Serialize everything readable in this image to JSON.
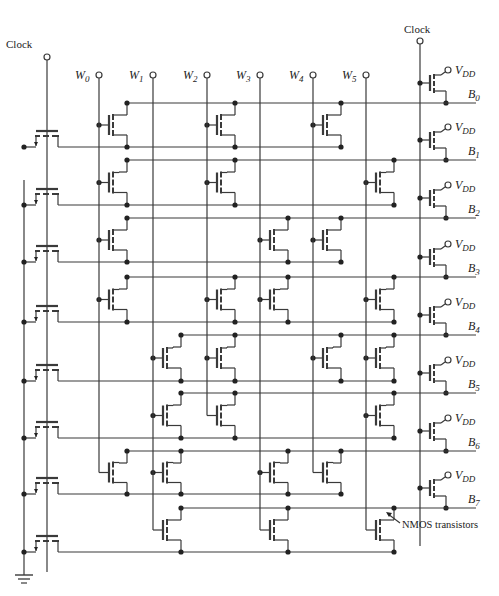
{
  "diagram": {
    "type": "NMOS ROM array with clocked PMOS precharge",
    "clock_left_label": "Clock",
    "clock_right_label": "Clock",
    "vdd_label": "V",
    "vdd_sub": "DD",
    "annotation": "NMOS transistors",
    "word_lines": [
      {
        "label": "W",
        "sub": "0"
      },
      {
        "label": "W",
        "sub": "1"
      },
      {
        "label": "W",
        "sub": "2"
      },
      {
        "label": "W",
        "sub": "3"
      },
      {
        "label": "W",
        "sub": "4"
      },
      {
        "label": "W",
        "sub": "5"
      }
    ],
    "bit_lines": [
      {
        "label": "B",
        "sub": "0",
        "transistors_at": [
          0,
          2,
          4
        ]
      },
      {
        "label": "B",
        "sub": "1",
        "transistors_at": [
          0,
          2,
          5
        ]
      },
      {
        "label": "B",
        "sub": "2",
        "transistors_at": [
          0,
          3,
          4
        ]
      },
      {
        "label": "B",
        "sub": "3",
        "transistors_at": [
          0,
          2,
          3,
          5
        ]
      },
      {
        "label": "B",
        "sub": "4",
        "transistors_at": [
          1,
          2,
          4,
          5
        ]
      },
      {
        "label": "B",
        "sub": "5",
        "transistors_at": [
          1,
          2,
          5
        ]
      },
      {
        "label": "B",
        "sub": "6",
        "transistors_at": [
          0,
          1,
          3,
          4
        ]
      },
      {
        "label": "B",
        "sub": "7",
        "transistors_at": [
          1,
          3,
          5
        ]
      }
    ],
    "colors": {
      "line": "#3a3a3a",
      "text": "#222222",
      "background": "#ffffff"
    }
  }
}
